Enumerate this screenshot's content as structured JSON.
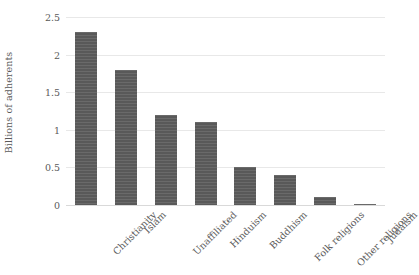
{
  "chart_data": {
    "type": "bar",
    "title": "",
    "subtitle": "",
    "xlabel": "",
    "ylabel": "Billions of adherents",
    "categories": [
      "Christianity",
      "Islam",
      "Unaffiliated",
      "Hinduism",
      "Buddhism",
      "Folk religions",
      "Other religions",
      "Judaism"
    ],
    "values": [
      2.3,
      1.8,
      1.2,
      1.1,
      0.5,
      0.4,
      0.1,
      0.015
    ],
    "ylim": [
      0,
      2.5
    ],
    "y_ticks": [
      0,
      0.5,
      1,
      1.5,
      2,
      2.5
    ],
    "y_tick_labels": [
      "0",
      "0.5",
      "1",
      "1.5",
      "2",
      "2.5"
    ],
    "grid": true,
    "legend": false,
    "legend_position": "none",
    "bar_color": "#595959",
    "gridline_color": "#e8e8e8",
    "text_color": "#5a5a5a",
    "background_color": "#ffffff"
  }
}
